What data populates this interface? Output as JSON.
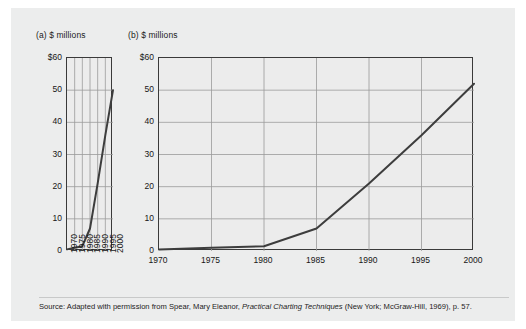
{
  "figure": {
    "background_color": "#eceded",
    "line_color": "#3d3d3d",
    "grid_color": "#9b9b9b",
    "axis_color": "#3a3a3a",
    "charts": [
      {
        "panel_label": "(a) $ millions",
        "name": "chart-a"
      },
      {
        "panel_label": "(b) $ millions",
        "name": "chart-b"
      }
    ]
  },
  "caption": {
    "part1": "Source: Adapted with permission from Spear, Mary Eleanor, ",
    "title": "Practical Charting Techniques",
    "part2": " (New York; McGraw-Hill, 1969), p. 57."
  },
  "chart_data": [
    {
      "type": "line",
      "name": "chart-a",
      "title": "(a) $ millions",
      "xlabel": "",
      "ylabel": "$ millions",
      "x": [
        1970,
        1975,
        1980,
        1985,
        1990,
        1995,
        2000
      ],
      "xtick_labels": [
        "1970",
        "1975",
        "1980",
        "1985",
        "1990",
        "1995",
        "2000"
      ],
      "xtick_rotation": -90,
      "values": [
        0.5,
        1,
        1.5,
        7,
        21,
        36,
        50
      ],
      "ytick_labels": [
        "$60",
        "50",
        "40",
        "30",
        "20",
        "10",
        "0"
      ],
      "yticks": [
        60,
        50,
        40,
        30,
        20,
        10,
        0
      ],
      "ylim": [
        0,
        60
      ],
      "xlim": [
        1970,
        2000
      ],
      "grid": true,
      "grid_orientation": "vertical-and-horizontal",
      "aspect_note": "narrow plot, steep slope"
    },
    {
      "type": "line",
      "name": "chart-b",
      "title": "(b) $ millions",
      "xlabel": "",
      "ylabel": "$ millions",
      "x": [
        1970,
        1975,
        1980,
        1985,
        1990,
        1995,
        2000
      ],
      "xtick_labels": [
        "1970",
        "1975",
        "1980",
        "1985",
        "1990",
        "1995",
        "2000"
      ],
      "xtick_rotation": 0,
      "values": [
        0.5,
        1,
        1.5,
        7,
        21,
        36,
        52
      ],
      "ytick_labels": [
        "$60",
        "50",
        "40",
        "30",
        "20",
        "10",
        "0"
      ],
      "yticks": [
        60,
        50,
        40,
        30,
        20,
        10,
        0
      ],
      "ylim": [
        0,
        60
      ],
      "xlim": [
        1970,
        2000
      ],
      "grid": true,
      "grid_orientation": "vertical-and-horizontal",
      "aspect_note": "wide plot, gentle slope"
    }
  ]
}
